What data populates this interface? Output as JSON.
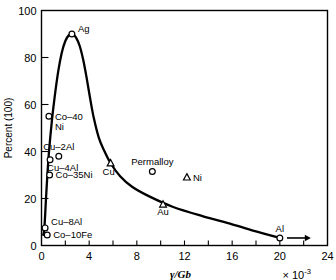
{
  "chart_data": {
    "type": "line",
    "title": "",
    "xlabel": "γ/Gb",
    "ylabel": "Percent (100)",
    "x_exponent_prefix": "×",
    "x_exponent_base": "10",
    "x_exponent_power": "-3",
    "xlim": [
      0,
      24
    ],
    "ylim": [
      0,
      100
    ],
    "xticks": [
      0,
      2,
      4,
      6,
      8,
      10,
      12,
      14,
      16,
      18,
      20,
      22,
      24
    ],
    "xtick_labels": [
      "0",
      "",
      "4",
      "",
      "8",
      "",
      "12",
      "",
      "16",
      "",
      "20",
      "",
      "24"
    ],
    "yticks": [
      0,
      20,
      40,
      60,
      80,
      100
    ],
    "ytick_labels": [
      "0",
      "20",
      "40",
      "60",
      "80",
      "100"
    ],
    "grid": false,
    "legend": "none",
    "series": [
      {
        "name": "curve",
        "x": [
          0.15,
          0.25,
          0.4,
          0.6,
          0.85,
          1.1,
          1.4,
          1.7,
          2.0,
          2.3,
          2.6,
          2.9,
          3.2,
          3.5,
          3.8,
          4.1,
          4.4,
          4.8,
          5.2,
          5.8,
          6.6,
          7.6,
          9.0,
          11.0,
          13.5,
          16.0,
          18.0,
          20.0
        ],
        "y": [
          4.5,
          8.0,
          22.0,
          38.0,
          52.0,
          63.0,
          74.0,
          82.0,
          87.0,
          89.5,
          90.0,
          88.5,
          85.0,
          79.0,
          71.0,
          62.0,
          54.0,
          46.0,
          41.0,
          35.0,
          29.5,
          25.0,
          21.0,
          16.5,
          12.5,
          9.0,
          6.0,
          3.2
        ]
      }
    ],
    "points": [
      {
        "label": "Ag",
        "marker": "circle",
        "x": 2.55,
        "y": 90.0,
        "label_pos": "right-up",
        "on_curve": true
      },
      {
        "label": "Co–40\nNi",
        "marker": "circle",
        "x": 0.62,
        "y": 55.0,
        "label_pos": "right",
        "on_curve": true
      },
      {
        "label": "Cu–2Al",
        "marker": "circle",
        "x": 1.45,
        "y": 38.0,
        "label_pos": "above",
        "on_curve": false
      },
      {
        "label": "Cu–4Al",
        "marker": "circle",
        "x": 0.72,
        "y": 36.5,
        "label_pos": "below-right",
        "on_curve": true
      },
      {
        "label": "Co–35Ni",
        "marker": "circle",
        "x": 0.68,
        "y": 30.0,
        "label_pos": "right",
        "on_curve": true
      },
      {
        "label": "Cu–8Al",
        "marker": "circle",
        "x": 0.3,
        "y": 7.5,
        "label_pos": "right-up",
        "on_curve": true
      },
      {
        "label": "Co–10Fe",
        "marker": "circle",
        "x": 0.48,
        "y": 4.5,
        "label_pos": "right",
        "on_curve": false
      },
      {
        "label": "Cu",
        "marker": "triangle",
        "x": 5.8,
        "y": 35.0,
        "label_pos": "below-left",
        "on_curve": true
      },
      {
        "label": "Permalloy",
        "marker": "circle",
        "x": 9.3,
        "y": 31.5,
        "label_pos": "above",
        "on_curve": false
      },
      {
        "label": "Ni",
        "marker": "triangle",
        "x": 12.2,
        "y": 29.0,
        "label_pos": "right",
        "on_curve": false
      },
      {
        "label": "Au",
        "marker": "triangle",
        "x": 10.2,
        "y": 17.5,
        "label_pos": "below",
        "on_curve": false
      },
      {
        "label": "Al",
        "marker": "circle",
        "x": 20.0,
        "y": 3.2,
        "label_pos": "above",
        "on_curve": true
      }
    ],
    "annotations": [
      {
        "name": "al-right-arrow",
        "type": "arrow",
        "from_x": 20.6,
        "from_y": 3.2,
        "to_x": 22.6,
        "to_y": 3.2
      }
    ]
  }
}
